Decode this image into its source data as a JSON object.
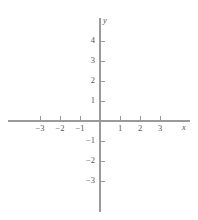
{
  "figure": {
    "background_color": "#ffffff",
    "axis_color": "#9a9a9a",
    "text_color": "#565656",
    "width": 198,
    "height": 220
  },
  "chart_data": {
    "type": "scatter",
    "title": "",
    "subtitle": "",
    "xlabel": "x",
    "ylabel": "y",
    "xlim": [
      -3.6,
      3.8
    ],
    "ylim": [
      -3.8,
      4.4
    ],
    "grid": false,
    "legend": null,
    "annotations": [],
    "series": [],
    "x_ticks": [
      {
        "value": -3,
        "label": "−3"
      },
      {
        "value": -2,
        "label": "−2"
      },
      {
        "value": -1,
        "label": "−1"
      },
      {
        "value": 1,
        "label": "1"
      },
      {
        "value": 2,
        "label": "2"
      },
      {
        "value": 3,
        "label": "3"
      }
    ],
    "y_ticks": [
      {
        "value": 4,
        "label": "4"
      },
      {
        "value": 3,
        "label": "3"
      },
      {
        "value": 2,
        "label": "2"
      },
      {
        "value": 1,
        "label": "1"
      },
      {
        "value": -1,
        "label": "−1"
      },
      {
        "value": -2,
        "label": "−2"
      },
      {
        "value": -3,
        "label": "−3"
      }
    ],
    "origin_label": "",
    "tick_spacing_px": 20
  },
  "geometry": {
    "origin_x": 100,
    "origin_y": 121,
    "unit_px": 20,
    "x_axis_start": 8,
    "x_axis_end": 190,
    "y_axis_top": 18,
    "y_axis_bottom": 212,
    "x_tick_length": 5,
    "y_tick_length": 5
  }
}
